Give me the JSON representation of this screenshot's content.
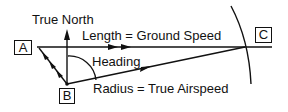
{
  "diagram": {
    "type": "wind-triangle",
    "points": {
      "A": "A",
      "B": "B",
      "C": "C"
    },
    "labels": {
      "north": "True North",
      "length": "Length = Ground Speed",
      "heading": "Heading",
      "radius": "Radius = True Airspeed"
    },
    "colors": {
      "stroke": "#111111",
      "background": "#ffffff"
    }
  }
}
